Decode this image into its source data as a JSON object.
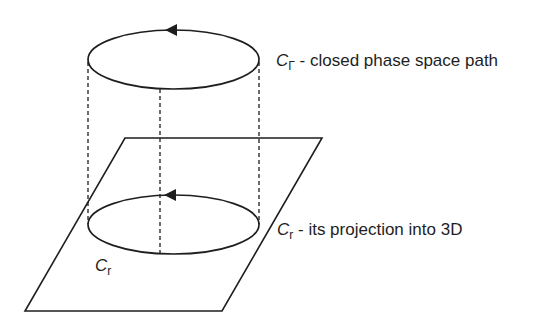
{
  "diagram": {
    "labels": {
      "top": {
        "symbol": "C",
        "subscript": "Γ",
        "text": " - closed phase space path"
      },
      "right": {
        "symbol": "C",
        "subscript": "r",
        "text": " - its projection into 3D"
      },
      "bottom": {
        "symbol": "C",
        "subscript": "r"
      }
    },
    "colors": {
      "stroke": "#1e1e1e",
      "background": "#ffffff"
    }
  }
}
